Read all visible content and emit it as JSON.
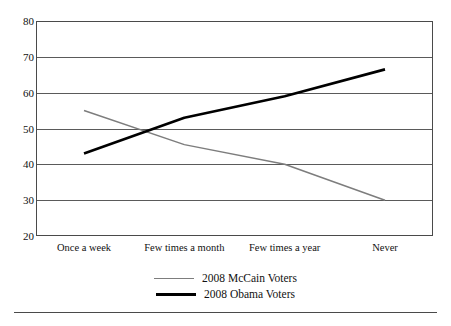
{
  "chart_data": {
    "type": "line",
    "title": "",
    "subtitle": "",
    "xlabel": "",
    "ylabel": "",
    "categories": [
      "Once a week",
      "Few times a month",
      "Few times a year",
      "Never"
    ],
    "ylim": [
      20,
      80
    ],
    "yticks": [
      80,
      70,
      60,
      50,
      40,
      30,
      20
    ],
    "grid": "horizontal",
    "legend_position": "bottom-center",
    "series": [
      {
        "name": "2008 McCain Voters",
        "color": "#7d7d7d",
        "line_width": 1.5,
        "values": [
          55,
          45.5,
          40,
          30
        ]
      },
      {
        "name": "2008 Obama Voters",
        "color": "#000000",
        "line_width": 2.6,
        "values": [
          43,
          53,
          59,
          66.5
        ]
      }
    ]
  },
  "legend": {
    "items": [
      {
        "label": "2008 McCain Voters",
        "swatch": "mccain"
      },
      {
        "label": "2008 Obama Voters",
        "swatch": "obama"
      }
    ]
  },
  "axes": {
    "y_tick_labels": [
      "80",
      "70",
      "60",
      "50",
      "40",
      "30",
      "20"
    ],
    "x_tick_labels": [
      "Once a week",
      "Few times a month",
      "Few times a year",
      "Never"
    ]
  }
}
